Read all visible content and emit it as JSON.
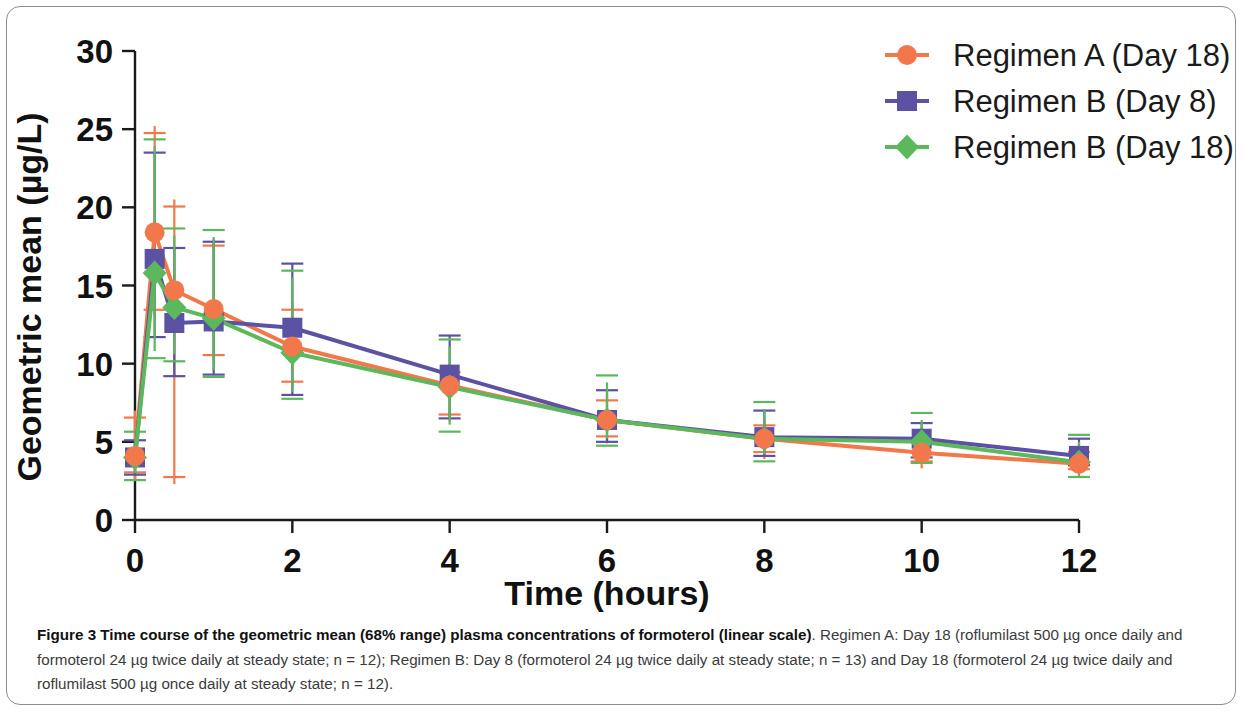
{
  "figure": {
    "caption_bold": "Figure 3 Time course of the geometric mean (68% range) plasma concentrations of formoterol (linear scale)",
    "caption_rest": ". Regimen A: Day 18 (roflumilast 500 µg once daily and formoterol 24 µg twice daily at steady state; n = 12); Regimen B: Day 8 (formoterol 24 µg twice daily at steady state; n = 13) and Day 18 (formoterol 24 µg twice daily and roflumilast 500 µg once daily at steady state; n = 12)."
  },
  "chart_data": {
    "type": "line",
    "title": "",
    "xlabel": "Time (hours)",
    "ylabel": "Geometric mean (µg/L)",
    "xlim": [
      0,
      12
    ],
    "ylim": [
      0,
      30
    ],
    "xticks": [
      0,
      2,
      4,
      6,
      8,
      10,
      12
    ],
    "yticks": [
      0,
      5,
      10,
      15,
      20,
      25,
      30
    ],
    "grid": false,
    "legend_position": "top-right",
    "error_bars": "68% range",
    "x": [
      0,
      0.25,
      0.5,
      1,
      2,
      4,
      6,
      8,
      10,
      12
    ],
    "series": [
      {
        "name": "Regimen A (Day 18)",
        "color": "#F2784B",
        "marker": "circle",
        "values": [
          4.1,
          18.4,
          14.7,
          13.5,
          11.1,
          8.6,
          6.4,
          5.2,
          4.3,
          3.6
        ],
        "err_low": [
          2.6,
          13.0,
          2.3,
          10.1,
          8.4,
          6.3,
          4.9,
          3.9,
          3.3,
          2.8
        ],
        "err_high": [
          7.0,
          25.2,
          20.5,
          18.0,
          13.9,
          9.9,
          8.1,
          6.5,
          5.6,
          4.8
        ]
      },
      {
        "name": "Regimen B (Day 8)",
        "color": "#5B52A3",
        "marker": "square",
        "values": [
          4.0,
          16.7,
          12.6,
          12.7,
          12.3,
          9.3,
          6.4,
          5.3,
          5.2,
          4.1
        ],
        "err_low": [
          2.9,
          11.7,
          9.2,
          9.3,
          8.0,
          6.5,
          5.0,
          4.1,
          4.0,
          3.5
        ],
        "err_high": [
          5.1,
          23.5,
          17.4,
          17.8,
          16.4,
          11.8,
          8.3,
          7.0,
          6.2,
          5.2
        ]
      },
      {
        "name": "Regimen B (Day 18)",
        "color": "#5CB85C",
        "marker": "diamond",
        "values": [
          4.0,
          15.8,
          13.6,
          12.9,
          10.7,
          8.5,
          6.4,
          5.2,
          5.0,
          3.7
        ],
        "err_low": [
          3.0,
          10.8,
          10.6,
          9.6,
          8.2,
          6.1,
          5.2,
          4.2,
          4.1,
          3.2
        ],
        "err_high": [
          5.2,
          23.9,
          18.2,
          18.1,
          15.5,
          11.1,
          8.8,
          7.1,
          6.4,
          5.0
        ]
      }
    ]
  },
  "legend": {
    "items": [
      {
        "label": "Regimen A (Day 18)",
        "color": "#F2784B",
        "marker": "circle"
      },
      {
        "label": "Regimen B (Day 8)",
        "color": "#5B52A3",
        "marker": "square"
      },
      {
        "label": "Regimen B (Day 18)",
        "color": "#5CB85C",
        "marker": "diamond"
      }
    ]
  }
}
